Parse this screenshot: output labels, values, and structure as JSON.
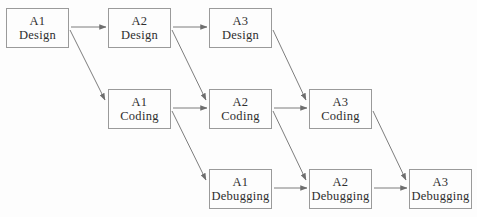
{
  "diagram": {
    "colors": {
      "background": "#fdfdfd",
      "box_fill": "#fdfdfd",
      "box_border": "#9a9a9a",
      "arrow": "#6e6e6e",
      "text": "#2e2e2e"
    },
    "nodes": [
      {
        "id": "a1-design",
        "activity": "A1",
        "phase": "Design",
        "col": 0,
        "row": 0
      },
      {
        "id": "a2-design",
        "activity": "A2",
        "phase": "Design",
        "col": 1,
        "row": 0
      },
      {
        "id": "a3-design",
        "activity": "A3",
        "phase": "Design",
        "col": 2,
        "row": 0
      },
      {
        "id": "a1-coding",
        "activity": "A1",
        "phase": "Coding",
        "col": 1,
        "row": 1
      },
      {
        "id": "a2-coding",
        "activity": "A2",
        "phase": "Coding",
        "col": 2,
        "row": 1
      },
      {
        "id": "a3-coding",
        "activity": "A3",
        "phase": "Coding",
        "col": 3,
        "row": 1
      },
      {
        "id": "a1-debugging",
        "activity": "A1",
        "phase": "Debugging",
        "col": 2,
        "row": 2
      },
      {
        "id": "a2-debugging",
        "activity": "A2",
        "phase": "Debugging",
        "col": 3,
        "row": 2
      },
      {
        "id": "a3-debugging",
        "activity": "A3",
        "phase": "Debugging",
        "col": 4,
        "row": 2
      }
    ],
    "edges": [
      {
        "from": "a1-design",
        "to": "a2-design"
      },
      {
        "from": "a2-design",
        "to": "a3-design"
      },
      {
        "from": "a1-design",
        "to": "a1-coding"
      },
      {
        "from": "a2-design",
        "to": "a2-coding"
      },
      {
        "from": "a3-design",
        "to": "a3-coding"
      },
      {
        "from": "a1-coding",
        "to": "a2-coding"
      },
      {
        "from": "a2-coding",
        "to": "a3-coding"
      },
      {
        "from": "a1-coding",
        "to": "a1-debugging"
      },
      {
        "from": "a2-coding",
        "to": "a2-debugging"
      },
      {
        "from": "a3-coding",
        "to": "a3-debugging"
      },
      {
        "from": "a1-debugging",
        "to": "a2-debugging"
      },
      {
        "from": "a2-debugging",
        "to": "a3-debugging"
      }
    ]
  }
}
